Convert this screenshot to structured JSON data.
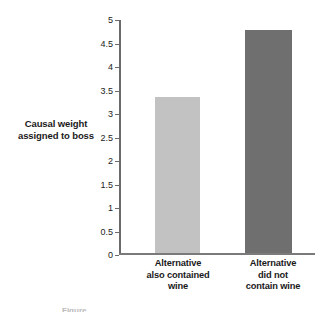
{
  "chart_data": {
    "type": "bar",
    "title": "",
    "xlabel": "",
    "ylabel": "Causal weight assigned to boss",
    "ylabel_lines": [
      "Causal weight",
      "assigned to boss"
    ],
    "categories": [
      "Alternative also contained wine",
      "Alternative did not contain wine"
    ],
    "category_lines": [
      [
        "Alternative",
        "also contained",
        "wine"
      ],
      [
        "Alternative",
        "did not",
        "contain wine"
      ]
    ],
    "values": [
      3.33,
      4.75
    ],
    "ylim": [
      0,
      5
    ],
    "ytick_values": [
      0,
      0.5,
      1,
      1.5,
      2,
      2.5,
      3,
      3.5,
      4,
      4.5,
      5
    ],
    "ytick_labels": [
      "0",
      "0.5",
      "1",
      "1.5",
      "2",
      "2.5",
      "3",
      "3.5",
      "4",
      "4.5",
      "5"
    ],
    "grid": false,
    "legend": false,
    "bar_colors": [
      "#c2c2c2",
      "#6f6f6f"
    ],
    "axis_color": "#6b6b6b"
  },
  "caption_fragment": "Figure"
}
